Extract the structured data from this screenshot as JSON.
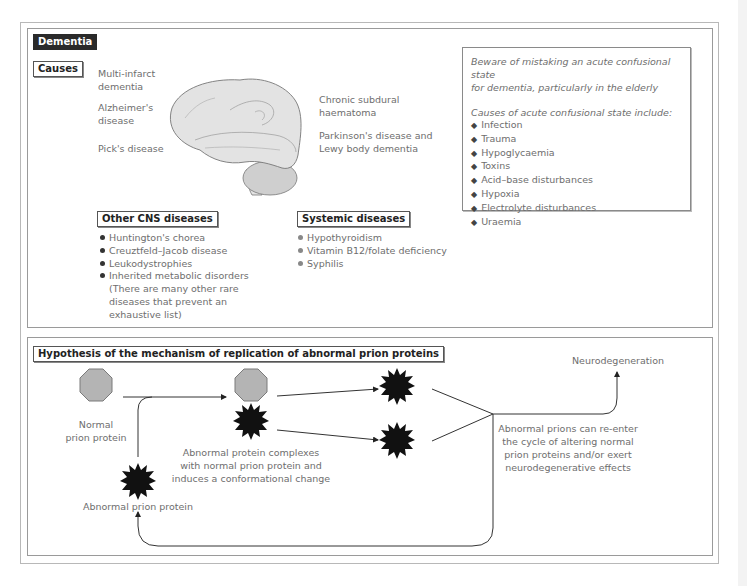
{
  "dementia_panel": {
    "title": "Dementia",
    "causes_label": "Causes",
    "brain_labels_left": [
      "Multi-infarct",
      "dementia",
      "Alzheimer's",
      "disease",
      "Pick's disease"
    ],
    "brain_labels_right": [
      "Chronic subdural",
      "haematoma",
      "Parkinson's disease and",
      "Lewy body dementia"
    ],
    "other_cns": {
      "title": "Other CNS diseases",
      "items": [
        "Huntington's chorea",
        "Creuztfeld–Jacob disease",
        "Leukodystrophies",
        "Inherited metabolic disorders"
      ],
      "note": [
        "(There are many other rare",
        "diseases that prevent an",
        "exhaustive list)"
      ]
    },
    "systemic": {
      "title": "Systemic diseases",
      "items": [
        "Hypothyroidism",
        "Vitamin B12/folate deficiency",
        "Syphilis"
      ]
    },
    "info_box": {
      "warning": [
        "Beware of mistaking an acute confusional state",
        "for dementia, particularly in the elderly"
      ],
      "causes_heading": "Causes of acute confusional state include:",
      "causes": [
        "Infection",
        "Trauma",
        "Hypoglycaemia",
        "Toxins",
        "Acid–base disturbances",
        "Hypoxia",
        "Electrolyte disturbances",
        "Uraemia"
      ],
      "bullet_icon": "◆"
    }
  },
  "prion_panel": {
    "title": "Hypothesis of the mechanism of replication of abnormal prion proteins",
    "normal_label": [
      "Normal",
      "prion protein"
    ],
    "abnormal_label": "Abnormal prion protein",
    "complex_label": [
      "Abnormal protein complexes",
      "with normal prion protein and",
      "induces a conformational change"
    ],
    "neuro_label": "Neurodegeneration",
    "reenter_label": [
      "Abnormal prions can re-enter",
      "the cycle of altering normal",
      "prion proteins and/or exert",
      "neurodegenerative effects"
    ]
  },
  "colors": {
    "normal_prion_fill": "#b4b4b4",
    "abnormal_prion_fill": "#111111",
    "brain_fill": "#e3e3e3",
    "cerebellum_fill": "#cfcfcf",
    "label_text": "#6e6e6e",
    "frame": "#9a9a9a"
  }
}
